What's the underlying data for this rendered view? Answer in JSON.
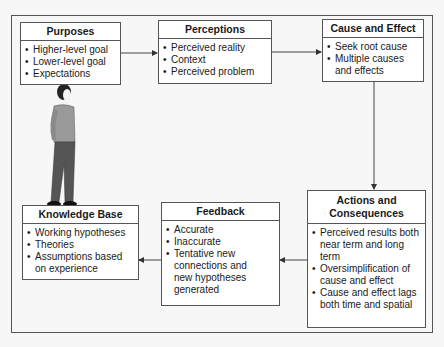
{
  "boxes": {
    "purposes": {
      "title": "Purposes",
      "items": [
        "Higher-level goal",
        "Lower-level goal",
        "Expectations"
      ]
    },
    "perceptions": {
      "title": "Perceptions",
      "items": [
        "Perceived reality",
        "Context",
        "Perceived problem"
      ]
    },
    "cause_effect": {
      "title": "Cause and Effect",
      "items": [
        "Seek root cause",
        "Multiple causes and effects"
      ]
    },
    "actions": {
      "title": "Actions and Consequences",
      "items": [
        "Perceived results both near term and long term",
        "Oversimplification of cause and effect",
        "Cause and effect lags both time and spatial"
      ]
    },
    "feedback": {
      "title": "Feedback",
      "items": [
        "Accurate",
        "Inaccurate",
        "Tentative new connections and new hypotheses generated"
      ]
    },
    "knowledge": {
      "title": "Knowledge Base",
      "items": [
        "Working hypotheses",
        "Theories",
        "Assumptions based on experience"
      ]
    }
  },
  "flow": [
    "Purposes",
    "Perceptions",
    "Cause and Effect",
    "Actions and Consequences",
    "Feedback",
    "Knowledge Base"
  ],
  "colors": {
    "line": "#555555",
    "box_bg": "#ffffff",
    "page_bg": "#f7f7f7"
  }
}
